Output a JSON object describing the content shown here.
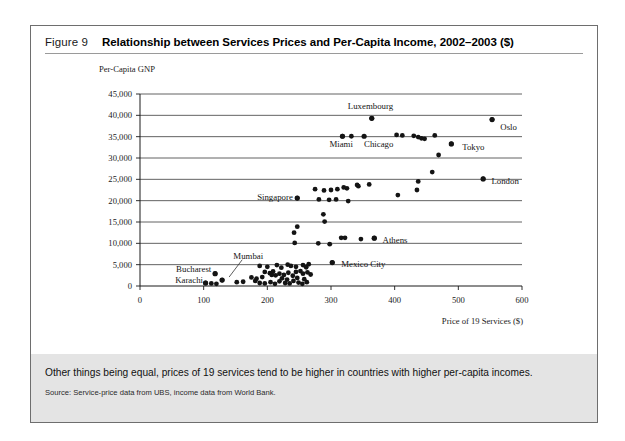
{
  "figure": {
    "number_label": "Figure 9",
    "title": "Relationship between Services Prices and Per-Capita Income, 2002–2003 ($)",
    "caption": "Other things being equal, prices of 19 services tend to be higher in countries with higher per-capita incomes.",
    "source": "Source: Service-price data from UBS, income data from World Bank."
  },
  "chart_data": {
    "type": "scatter",
    "title": "Relationship between Services Prices and Per-Capita Income, 2002–2003 ($)",
    "xlabel": "Price of 19 Services ($)",
    "ylabel": "Per-Capita GNP",
    "xlim": [
      0,
      600
    ],
    "ylim": [
      0,
      45000
    ],
    "xticks": [
      0,
      100,
      200,
      300,
      400,
      500,
      600
    ],
    "yticks": [
      0,
      5000,
      10000,
      15000,
      20000,
      25000,
      30000,
      35000,
      40000,
      45000
    ],
    "xtick_labels": [
      "0",
      "100",
      "200",
      "300",
      "400",
      "500",
      "600"
    ],
    "ytick_labels": [
      "0",
      "5,000",
      "10,000",
      "15,000",
      "20,000",
      "25,000",
      "30,000",
      "35,000",
      "40,000",
      "45,000"
    ],
    "grid": "horizontal",
    "legend": "none",
    "marker_color": "#141414",
    "annotations": [
      {
        "label": "Luxembourg",
        "x": 364,
        "y": 39300,
        "label_x": 362,
        "label_y": 42100,
        "anchor": "middle"
      },
      {
        "label": "Oslo",
        "x": 553,
        "y": 39000,
        "label_x": 566,
        "label_y": 37300,
        "anchor": "start"
      },
      {
        "label": "Miami",
        "x": 318,
        "y": 35100,
        "label_x": 316,
        "label_y": 33300,
        "anchor": "middle"
      },
      {
        "label": "Chicago",
        "x": 352,
        "y": 35100,
        "label_x": 375,
        "label_y": 33300,
        "anchor": "middle"
      },
      {
        "label": "Tokyo",
        "x": 489,
        "y": 33300,
        "label_x": 506,
        "label_y": 32600,
        "anchor": "start"
      },
      {
        "label": "London",
        "x": 539,
        "y": 25100,
        "label_x": 552,
        "label_y": 24700,
        "anchor": "start"
      },
      {
        "label": "Singapore",
        "x": 247,
        "y": 20600,
        "label_x": 240,
        "label_y": 20900,
        "anchor": "end"
      },
      {
        "label": "Athens",
        "x": 368,
        "y": 11200,
        "label_x": 381,
        "label_y": 10800,
        "anchor": "start"
      },
      {
        "label": "Mexico City",
        "x": 302,
        "y": 5500,
        "label_x": 316,
        "label_y": 5200,
        "anchor": "start"
      },
      {
        "label": "Mumbai",
        "x": 129,
        "y": 1400,
        "label_x": 170,
        "label_y": 7100,
        "anchor": "middle"
      },
      {
        "label": "Bucharest",
        "x": 118,
        "y": 2900,
        "label_x": 112,
        "label_y": 4000,
        "anchor": "end"
      },
      {
        "label": "Karachi",
        "x": 103,
        "y": 700,
        "label_x": 99,
        "label_y": 1300,
        "anchor": "end"
      }
    ],
    "points": [
      [
        364,
        39300
      ],
      [
        553,
        39000
      ],
      [
        318,
        35100
      ],
      [
        332,
        35100
      ],
      [
        403,
        35400
      ],
      [
        412,
        35300
      ],
      [
        430,
        35200
      ],
      [
        437,
        34900
      ],
      [
        442,
        34600
      ],
      [
        447,
        34500
      ],
      [
        463,
        35300
      ],
      [
        489,
        33300
      ],
      [
        469,
        30700
      ],
      [
        539,
        25100
      ],
      [
        459,
        26700
      ],
      [
        437,
        24500
      ],
      [
        435,
        22500
      ],
      [
        405,
        21300
      ],
      [
        275,
        22700
      ],
      [
        289,
        22400
      ],
      [
        300,
        22500
      ],
      [
        310,
        22700
      ],
      [
        320,
        23100
      ],
      [
        325,
        22900
      ],
      [
        341,
        23700
      ],
      [
        343,
        23400
      ],
      [
        360,
        23800
      ],
      [
        247,
        20600
      ],
      [
        281,
        20300
      ],
      [
        297,
        20200
      ],
      [
        308,
        20300
      ],
      [
        327,
        19900
      ],
      [
        288,
        16800
      ],
      [
        290,
        15100
      ],
      [
        247,
        13900
      ],
      [
        242,
        12500
      ],
      [
        368,
        11200
      ],
      [
        316,
        11300
      ],
      [
        322,
        11300
      ],
      [
        347,
        11000
      ],
      [
        243,
        10100
      ],
      [
        280,
        10000
      ],
      [
        298,
        9800
      ],
      [
        302,
        5500
      ],
      [
        188,
        4700
      ],
      [
        200,
        4500
      ],
      [
        215,
        4900
      ],
      [
        222,
        4300
      ],
      [
        232,
        5000
      ],
      [
        237,
        4700
      ],
      [
        245,
        4500
      ],
      [
        256,
        4900
      ],
      [
        261,
        4400
      ],
      [
        265,
        5100
      ],
      [
        196,
        3300
      ],
      [
        204,
        3000
      ],
      [
        207,
        2600
      ],
      [
        209,
        3400
      ],
      [
        213,
        2500
      ],
      [
        219,
        2900
      ],
      [
        226,
        2600
      ],
      [
        233,
        3100
      ],
      [
        240,
        2400
      ],
      [
        245,
        3300
      ],
      [
        252,
        3500
      ],
      [
        256,
        2900
      ],
      [
        263,
        3200
      ],
      [
        268,
        2700
      ],
      [
        118,
        2900
      ],
      [
        129,
        1400
      ],
      [
        103,
        700
      ],
      [
        112,
        600
      ],
      [
        120,
        500
      ],
      [
        152,
        900
      ],
      [
        162,
        1000
      ],
      [
        181,
        1200
      ],
      [
        188,
        700
      ],
      [
        196,
        600
      ],
      [
        205,
        900
      ],
      [
        212,
        500
      ],
      [
        219,
        1100
      ],
      [
        228,
        700
      ],
      [
        235,
        600
      ],
      [
        241,
        1200
      ],
      [
        249,
        800
      ],
      [
        255,
        500
      ],
      [
        262,
        900
      ],
      [
        175,
        2000
      ],
      [
        183,
        1700
      ],
      [
        192,
        2100
      ],
      [
        223,
        1800
      ],
      [
        231,
        1500
      ],
      [
        247,
        1900
      ],
      [
        258,
        1600
      ]
    ]
  }
}
